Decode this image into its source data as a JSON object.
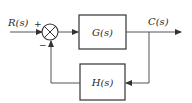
{
  "diagram": {
    "type": "negative-feedback-control-loop",
    "input": {
      "label": "R(s)"
    },
    "output": {
      "label": "C(s)"
    },
    "summing_junction": {
      "plus_sign": "+",
      "minus_sign": "−"
    },
    "forward_block": {
      "label": "G(s)"
    },
    "feedback_block": {
      "label": "H(s)"
    },
    "colors": {
      "line": "#555555",
      "box_border": "#333333",
      "text": "#2a2a2a",
      "background": "#ffffff"
    }
  }
}
